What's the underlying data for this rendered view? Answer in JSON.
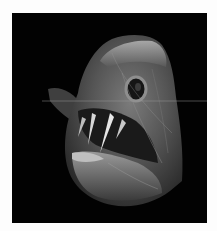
{
  "image": {
    "subject": "deep-sea fangtooth fish head",
    "background_color": "#020202",
    "border_color": "#fdfdfd",
    "fish_colors": {
      "body_light": "#b8b8b8",
      "body_mid": "#6e6e6e",
      "body_dark": "#2e2e2e",
      "highlight": "#e6e6e6"
    }
  }
}
